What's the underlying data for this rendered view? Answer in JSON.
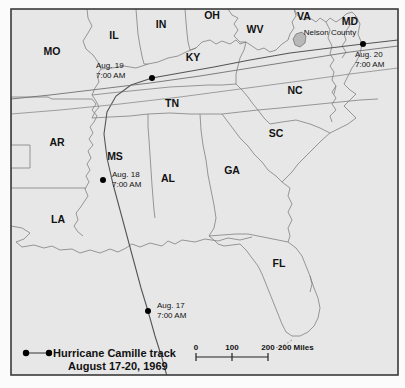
{
  "figure": {
    "background_color": "#fbfbfb",
    "map_fill_color": "#e7e7e7",
    "frame_color": "#3a3a3a",
    "border_color": "#7a7a7a",
    "track_color": "#555555",
    "marker_color": "#000000"
  },
  "state_labels": [
    {
      "code": "MO",
      "x": 52,
      "y": 52
    },
    {
      "code": "IL",
      "x": 114,
      "y": 36
    },
    {
      "code": "IN",
      "x": 161,
      "y": 25
    },
    {
      "code": "OH",
      "x": 212,
      "y": 16
    },
    {
      "code": "WV",
      "x": 255,
      "y": 30
    },
    {
      "code": "VA",
      "x": 304,
      "y": 17
    },
    {
      "code": "MD",
      "x": 350,
      "y": 22
    },
    {
      "code": "KY",
      "x": 193,
      "y": 58
    },
    {
      "code": "TN",
      "x": 172,
      "y": 104
    },
    {
      "code": "NC",
      "x": 295,
      "y": 91
    },
    {
      "code": "SC",
      "x": 276,
      "y": 134
    },
    {
      "code": "AR",
      "x": 57,
      "y": 143
    },
    {
      "code": "MS",
      "x": 115,
      "y": 157
    },
    {
      "code": "AL",
      "x": 168,
      "y": 179
    },
    {
      "code": "GA",
      "x": 232,
      "y": 171
    },
    {
      "code": "LA",
      "x": 58,
      "y": 220
    },
    {
      "code": "FL",
      "x": 279,
      "y": 264
    }
  ],
  "county_label": {
    "name": "Nelson County",
    "x": 330,
    "y": 35
  },
  "track_points": [
    {
      "label_line1": "Aug. 17",
      "label_line2": "7:00 AM",
      "dot_x": 148,
      "dot_y": 311,
      "text_x": 157,
      "text_y": 308
    },
    {
      "label_line1": "Aug. 18",
      "label_line2": "7:00 AM",
      "dot_x": 103,
      "dot_y": 180,
      "text_x": 112,
      "text_y": 177
    },
    {
      "label_line1": "Aug. 19",
      "label_line2": "7:00 AM",
      "dot_x": 152,
      "dot_y": 78,
      "text_x": 96,
      "text_y": 68
    },
    {
      "label_line1": "Aug. 20",
      "label_line2": "7:00 AM",
      "dot_x": 363,
      "dot_y": 44,
      "text_x": 355,
      "text_y": 57
    }
  ],
  "legend": {
    "line1": "Hurricane Camille track",
    "line2": "August 17-20, 1969",
    "dot_left_x": 26,
    "dot_right_x": 48,
    "dot_y": 353,
    "text_x": 52,
    "text_y": 357,
    "text2_y": 369
  },
  "scale_bar": {
    "unit_label": "200 Miles",
    "ticks": [
      {
        "label": "0",
        "x": 196
      },
      {
        "label": "100",
        "x": 232
      },
      {
        "label": "200",
        "x": 268
      }
    ],
    "bar_y": 356,
    "label_y": 350,
    "unit_x": 272
  },
  "frame": {
    "x": 11,
    "y": 9,
    "width": 387,
    "height": 366
  }
}
